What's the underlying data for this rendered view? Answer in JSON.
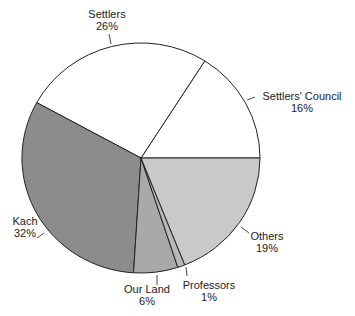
{
  "chart_data": {
    "type": "pie",
    "title": "",
    "start_angle_deg": 0,
    "direction": "counterclockwise",
    "categories": [
      "Settlers' Council",
      "Settlers",
      "Kach",
      "Our Land",
      "Professors",
      "Others"
    ],
    "values": [
      16,
      26,
      32,
      6,
      1,
      19
    ],
    "value_labels": [
      "16%",
      "26%",
      "32%",
      "6%",
      "1%",
      "19%"
    ],
    "colors": [
      "#ffffff",
      "#ffffff",
      "#8c8c8c",
      "#a9a9a9",
      "#b8b8b8",
      "#c9c9c9"
    ],
    "legend": "none (direct labels with leader lines)"
  },
  "labels": [
    {
      "name": "Settlers' Council",
      "pct": "16%",
      "x": 302,
      "y": 100,
      "leader": [
        [
          247,
          100
        ],
        [
          255,
          97
        ]
      ]
    },
    {
      "name": "Settlers",
      "pct": "26%",
      "x": 107,
      "y": 18,
      "leader": [
        [
          109,
          34
        ],
        [
          111,
          44
        ]
      ]
    },
    {
      "name": "Kach",
      "pct": "32%",
      "x": 25,
      "y": 225,
      "leader": [
        [
          37,
          238
        ],
        [
          44,
          233
        ]
      ]
    },
    {
      "name": "Our Land",
      "pct": "6%",
      "x": 147,
      "y": 293,
      "leader": [
        [
          157,
          275
        ],
        [
          157,
          285
        ]
      ]
    },
    {
      "name": "Professors",
      "pct": "1%",
      "x": 209,
      "y": 289,
      "leader": [
        [
          186,
          267
        ],
        [
          187,
          276
        ]
      ]
    },
    {
      "name": "Others",
      "pct": "19%",
      "x": 267,
      "y": 240,
      "leader": [
        [
          241,
          227
        ],
        [
          249,
          233
        ]
      ]
    }
  ]
}
